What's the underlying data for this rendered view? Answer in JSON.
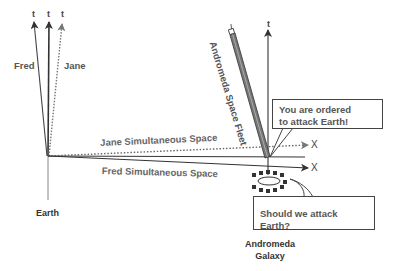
{
  "diagram": {
    "type": "spacetime-diagram",
    "observers": {
      "fred": {
        "label": "Fred",
        "axis_label": "t",
        "line_style": "solid"
      },
      "jane": {
        "label": "Jane",
        "axis_label": "t",
        "line_style": "dotted"
      },
      "earth_axis_label": "t"
    },
    "places": {
      "earth": "Earth",
      "andromeda_line1": "Andromeda",
      "andromeda_line2": "Galaxy",
      "andromeda_axis_label": "t"
    },
    "simultaneous_spaces": {
      "jane": {
        "label": "Jane Simultaneous Space",
        "axis_label": "X",
        "line_style": "dotted"
      },
      "fred": {
        "label": "Fred Simultaneous Space",
        "axis_label": "X",
        "line_style": "solid"
      }
    },
    "fleet": {
      "label": "Andromeda Space Fleet"
    },
    "speech_bubbles": {
      "order": {
        "line1": "You are ordered",
        "line2": "to attack Earth!"
      },
      "question": {
        "text": "Should we attack Earth?"
      }
    },
    "colors": {
      "line": "#333333",
      "dotted": "#666666",
      "text": "#555555",
      "fleet_fill": "#777777",
      "galaxy_squares": "#333333"
    }
  }
}
